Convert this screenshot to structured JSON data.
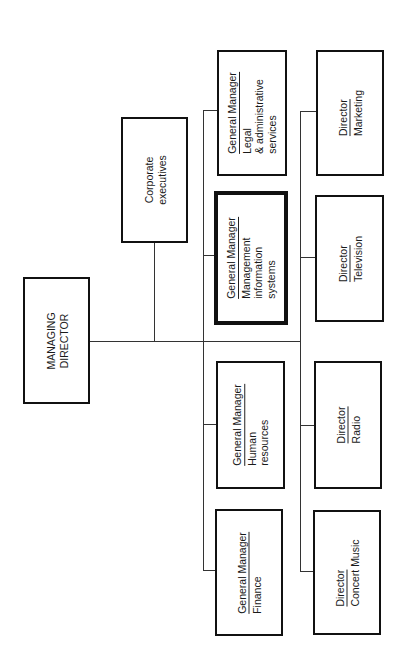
{
  "chart": {
    "orientation": "rotated-90-ccw",
    "root": {
      "id": "managing-director",
      "lines": [
        "MANAGING",
        "DIRECTOR"
      ]
    },
    "staff": {
      "id": "corporate-executives",
      "lines": [
        "Corporate",
        "executives"
      ]
    },
    "general_managers": [
      {
        "id": "gm-legal",
        "title": "General Manager",
        "lines": [
          "Legal",
          "& administrative",
          "services"
        ],
        "highlighted": false
      },
      {
        "id": "gm-mis",
        "title": "General Manager",
        "lines": [
          "Management",
          "information",
          "systems"
        ],
        "highlighted": true
      },
      {
        "id": "gm-hr",
        "title": "General Manager",
        "lines": [
          "Human",
          "resources"
        ],
        "highlighted": false
      },
      {
        "id": "gm-finance",
        "title": "General Manager",
        "lines": [
          "Finance"
        ],
        "highlighted": false
      }
    ],
    "directors": [
      {
        "id": "dir-marketing",
        "title": "Director",
        "lines": [
          "Marketing"
        ]
      },
      {
        "id": "dir-television",
        "title": "Director",
        "lines": [
          "Television"
        ]
      },
      {
        "id": "dir-radio",
        "title": "Director",
        "lines": [
          "Radio"
        ]
      },
      {
        "id": "dir-concert-music",
        "title": "Director",
        "lines": [
          "Concert Music"
        ]
      }
    ]
  }
}
